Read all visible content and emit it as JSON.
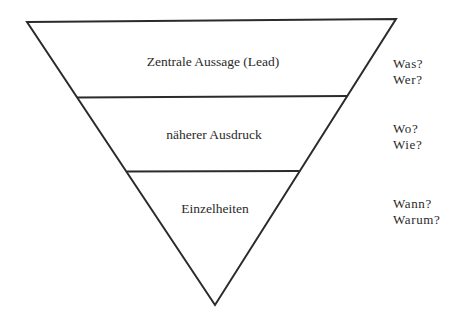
{
  "diagram": {
    "type": "inverted-pyramid",
    "colors": {
      "stroke": "#2b2b2b",
      "text": "#2a2a2a",
      "background": "#ffffff"
    },
    "layers": [
      {
        "label": "Zentrale Aussage (Lead)",
        "questions": [
          "Was?",
          "Wer?"
        ]
      },
      {
        "label": "näherer Ausdruck",
        "questions": [
          "Wo?",
          "Wie?"
        ]
      },
      {
        "label": "Einzelheiten",
        "questions": [
          "Wann?",
          "Warum?"
        ]
      }
    ]
  }
}
